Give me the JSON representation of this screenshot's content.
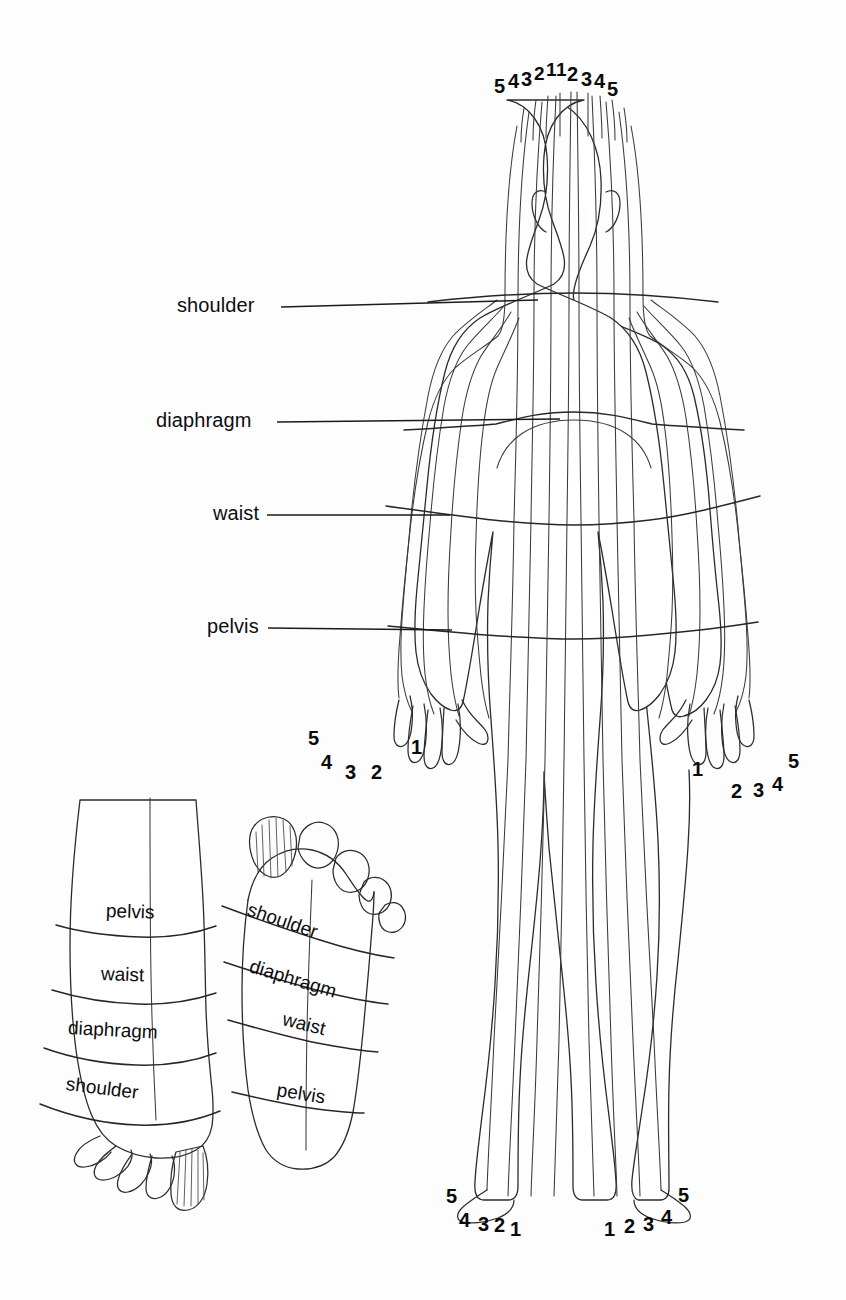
{
  "diagram": {
    "ink_color": "#2b2b2b",
    "background_color": "#fdfdfd"
  },
  "body_figure": {
    "view": "posterior-full-body",
    "transverse_labels": [
      {
        "id": "shoulder",
        "text": "shoulder"
      },
      {
        "id": "diaphragm",
        "text": "diaphragm"
      },
      {
        "id": "waist",
        "text": "waist"
      },
      {
        "id": "pelvis",
        "text": "pelvis"
      }
    ],
    "head_zone_numbers": {
      "left_side": [
        "5",
        "4",
        "3",
        "2",
        "1"
      ],
      "right_side": [
        "1",
        "2",
        "3",
        "4",
        "5"
      ]
    },
    "left_hand_numbers": [
      "5",
      "4",
      "3",
      "2",
      "1"
    ],
    "right_hand_numbers": [
      "1",
      "2",
      "3",
      "4",
      "5"
    ],
    "left_foot_numbers": [
      "5",
      "4",
      "3",
      "2",
      "1"
    ],
    "right_foot_numbers": [
      "1",
      "2",
      "3",
      "4",
      "5"
    ],
    "zone_count": 10
  },
  "foot_dorsal": {
    "view": "top-of-foot",
    "zone_labels": [
      "pelvis",
      "waist",
      "diaphragm",
      "shoulder"
    ]
  },
  "foot_plantar": {
    "view": "sole-of-foot",
    "zone_labels": [
      "shoulder",
      "diaphragm",
      "waist",
      "pelvis"
    ]
  }
}
